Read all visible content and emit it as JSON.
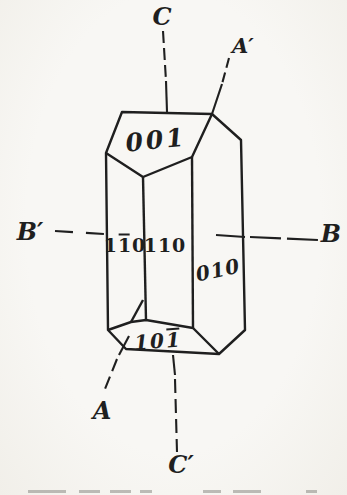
{
  "figure": {
    "type": "crystal-with-crystallographic-axes",
    "paper_color": "#f6f5f1",
    "ink_color": "#1f1f1f",
    "axis_labels": {
      "c_top": "C",
      "a_top_right": "A′",
      "b_left": "B′",
      "b_right": "B",
      "a_bottom_left": "A",
      "c_bottom": "C′"
    },
    "face_labels": {
      "top_face": "001",
      "front_left_face": {
        "pre": "1",
        "barred": "1",
        "post": "0"
      },
      "front_face": "110",
      "right_face": "010",
      "bottom_face": {
        "pre": "10",
        "barred": "1",
        "post": ""
      }
    }
  }
}
